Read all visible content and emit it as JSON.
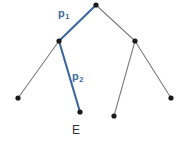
{
  "figure": {
    "width": 183,
    "height": 144,
    "background_color": "#ffffff"
  },
  "colors": {
    "path_highlight": "#3c68a0",
    "edge_default": "#7d7d7d",
    "node_fill": "#1a1a1a",
    "endpoint_label": "#333333"
  },
  "labels": {
    "p1": {
      "text": "p",
      "subscript": "1",
      "color": "#3c68a0",
      "x": 58,
      "y": 8
    },
    "p2": {
      "text": "p",
      "subscript": "2",
      "color": "#3c68a0",
      "x": 72,
      "y": 71
    },
    "endpoint": {
      "text": "E",
      "color": "#333333",
      "x": 72,
      "y": 124
    }
  },
  "chart_data": {
    "type": "diagram",
    "diagram_kind": "tree",
    "title": "",
    "nodes": [
      {
        "id": "root",
        "x": 96,
        "y": 5,
        "label": "",
        "highlighted": false
      },
      {
        "id": "n_left",
        "x": 59,
        "y": 41,
        "label": "",
        "highlighted": false
      },
      {
        "id": "n_right",
        "x": 135,
        "y": 41,
        "label": "",
        "highlighted": false
      },
      {
        "id": "leaf_ll",
        "x": 18,
        "y": 98,
        "label": "",
        "highlighted": false
      },
      {
        "id": "leaf_E",
        "x": 80,
        "y": 112,
        "label": "E",
        "highlighted": true
      },
      {
        "id": "leaf_rl",
        "x": 114,
        "y": 116,
        "label": "",
        "highlighted": false
      },
      {
        "id": "leaf_rr",
        "x": 171,
        "y": 98,
        "label": "",
        "highlighted": false
      }
    ],
    "edges": [
      {
        "id": "e_root_left",
        "from": "root",
        "to": "n_left",
        "label": "p1",
        "highlighted": true
      },
      {
        "id": "e_root_right",
        "from": "root",
        "to": "n_right",
        "label": "",
        "highlighted": false
      },
      {
        "id": "e_left_ll",
        "from": "n_left",
        "to": "leaf_ll",
        "label": "",
        "highlighted": false
      },
      {
        "id": "e_left_E",
        "from": "n_left",
        "to": "leaf_E",
        "label": "p2",
        "highlighted": true
      },
      {
        "id": "e_right_rl",
        "from": "n_right",
        "to": "leaf_rl",
        "label": "",
        "highlighted": false
      },
      {
        "id": "e_right_rr",
        "from": "n_right",
        "to": "leaf_rr",
        "label": "",
        "highlighted": false
      }
    ],
    "node_radius": 2.6,
    "highlighted_path": [
      "root",
      "n_left",
      "leaf_E"
    ],
    "legend": [],
    "grid": false
  }
}
